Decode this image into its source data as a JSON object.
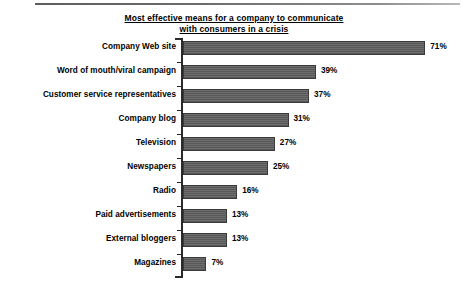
{
  "chart_data": {
    "type": "bar",
    "orientation": "horizontal",
    "title_line1": "Most effective means for a company to communicate",
    "title_line2": "with consumers in a crisis",
    "xlabel": "",
    "ylabel": "",
    "xlim": [
      0,
      71
    ],
    "grid": false,
    "legend": null,
    "value_suffix": "%",
    "categories": [
      "Company Web site",
      "Word of mouth/viral campaign",
      "Customer service representatives",
      "Company blog",
      "Television",
      "Newspapers",
      "Radio",
      "Paid advertisements",
      "External bloggers",
      "Magazines"
    ],
    "values": [
      71,
      39,
      37,
      31,
      27,
      25,
      16,
      13,
      13,
      7
    ],
    "value_labels": [
      "71%",
      "39%",
      "37%",
      "31%",
      "27%",
      "25%",
      "16%",
      "13%",
      "13%",
      "7%"
    ],
    "colors": {
      "bar_fill": "#5f5f5f",
      "bar_stroke": "#3a3a3a",
      "axis": "#2a2a2a",
      "text": "#000000",
      "background": "#ffffff"
    }
  }
}
